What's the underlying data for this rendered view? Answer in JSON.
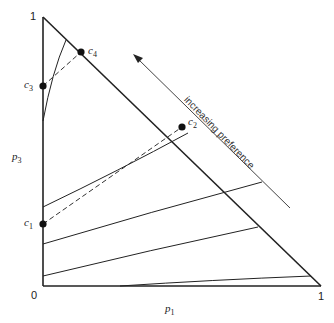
{
  "diagram": {
    "type": "probability-triangle (Marschak-Machina)",
    "axes": {
      "x_label": "p",
      "x_sub": "1",
      "y_label": "p",
      "y_sub": "3",
      "origin": "0",
      "x_max": "1",
      "y_max": "1"
    },
    "points": [
      {
        "label": "c",
        "sub": "1"
      },
      {
        "label": "c",
        "sub": "2"
      },
      {
        "label": "c",
        "sub": "3"
      },
      {
        "label": "c",
        "sub": "4"
      }
    ],
    "annotation": "increasing preference",
    "colors": {
      "line": "#222222",
      "background": "#ffffff"
    }
  }
}
